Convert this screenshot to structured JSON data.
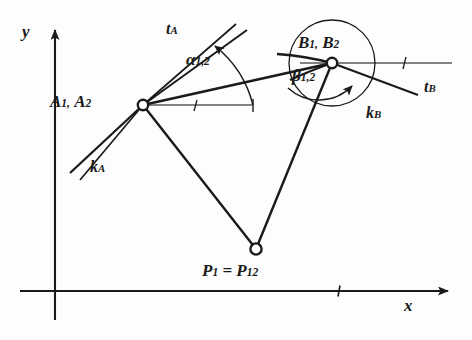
{
  "figure": {
    "kind": "kinematics-pole-diagram",
    "background_color": "#fdfdfd",
    "ink_color": "#1a1a1a",
    "width": 472,
    "height": 340
  },
  "axes": {
    "origin": {
      "x": 55,
      "y": 291
    },
    "x_axis": {
      "label": "x",
      "from": {
        "x": 20,
        "y": 291
      },
      "to": {
        "x": 455,
        "y": 291
      },
      "arrow": "right",
      "tick_at": {
        "x": 340,
        "y": 291
      },
      "label_pos": {
        "x": 408,
        "y": 296
      }
    },
    "y_axis": {
      "label": "y",
      "from": {
        "x": 55,
        "y": 320
      },
      "to": {
        "x": 55,
        "y": 22
      },
      "arrow": "up",
      "label_pos": {
        "x": 25,
        "y": 30
      }
    }
  },
  "points": [
    {
      "id": "A",
      "label_main": "A",
      "label": "A₁, A₂",
      "text_a": "A",
      "sub_a": "1,",
      "text_b": "A",
      "sub_b": "2",
      "x": 143,
      "y": 105,
      "marker": "open-circle",
      "label_pos": {
        "x": 52,
        "y": 92
      }
    },
    {
      "id": "B",
      "label_main": "B",
      "label": "B₁, B₂",
      "text_a": "B",
      "sub_a": "1,",
      "text_b": "B",
      "sub_b": "2",
      "x": 332,
      "y": 63,
      "marker": "open-circle",
      "label_pos": {
        "x": 298,
        "y": 34
      }
    },
    {
      "id": "P",
      "label": "P₁ = P₁₂",
      "text_a": "P",
      "sub_a": "1",
      "eq": " = ",
      "text_b": "P",
      "sub_b": "12",
      "x": 256,
      "y": 249,
      "marker": "open-circle",
      "label_pos": {
        "x": 203,
        "y": 262
      }
    }
  ],
  "curves": [
    {
      "id": "k_A",
      "text": "k",
      "sub": "A",
      "label": "kₐ",
      "description": "path-curve at A, two near-parallel rays down-left",
      "label_pos": {
        "x": 92,
        "y": 162
      }
    },
    {
      "id": "k_B",
      "text": "k",
      "sub": "B",
      "label": "kʙ",
      "description": "path-curve at B, arc with arrowhead",
      "label_pos": {
        "x": 368,
        "y": 108
      }
    },
    {
      "id": "t_A",
      "text": "t",
      "sub": "A",
      "label": "tₐ",
      "description": "tangent at A, two near-parallel rays up-right",
      "label_pos": {
        "x": 168,
        "y": 22
      }
    },
    {
      "id": "t_B",
      "text": "t",
      "sub": "B",
      "label": "tʙ",
      "description": "tangent at B, ray down-right",
      "label_pos": {
        "x": 426,
        "y": 82
      }
    }
  ],
  "angles": [
    {
      "id": "alpha",
      "text": "α",
      "sub": "1,2",
      "label": "α₁,₂",
      "at_point": "A",
      "description": "angle between line AB and tangent t_A, arc with arrowhead",
      "label_pos": {
        "x": 189,
        "y": 56
      }
    },
    {
      "id": "beta",
      "text": "β",
      "sub": "1,2",
      "label": "β₁,₂",
      "at_point": "B",
      "description": "angle at B between BP line and tangent t_B, arc with arrowhead",
      "label_pos": {
        "x": 294,
        "y": 74
      }
    }
  ],
  "segments": [
    {
      "id": "A-B",
      "from": "A",
      "to": "B",
      "description": "chord from A to B"
    },
    {
      "id": "A-P",
      "from": "A",
      "to": "P",
      "description": "ray from A to pole P"
    },
    {
      "id": "B-P",
      "from": "B",
      "to": "P",
      "description": "ray from B to pole P"
    }
  ],
  "reference_lines": [
    {
      "id": "ref-A",
      "description": "horizontal reference ray at A with tick",
      "from": {
        "x": 143,
        "y": 105
      },
      "to": {
        "x": 252,
        "y": 105
      },
      "tick_at": {
        "x": 196,
        "y": 105
      }
    },
    {
      "id": "ref-B",
      "description": "horizontal reference ray at B with tick",
      "from": {
        "x": 332,
        "y": 63
      },
      "to": {
        "x": 452,
        "y": 63
      },
      "tick_at": {
        "x": 404,
        "y": 63
      }
    }
  ]
}
